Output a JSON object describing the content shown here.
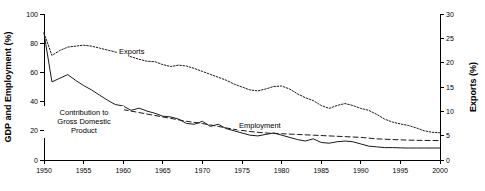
{
  "chart_data": {
    "type": "line",
    "title": "",
    "xlabel": "",
    "ylabel": "GDP and Employment (%)",
    "y2label": "Exports (%)",
    "xlim": [
      1950,
      2000
    ],
    "ylim": [
      0,
      100
    ],
    "y2lim": [
      0,
      30
    ],
    "grid": false,
    "legend_position": "inline-annotations",
    "x_ticks": [
      1950,
      1955,
      1960,
      1965,
      1970,
      1975,
      1980,
      1985,
      1990,
      1995,
      2000
    ],
    "y_ticks": [
      0,
      20,
      40,
      60,
      80,
      100
    ],
    "y2_ticks": [
      0,
      5,
      10,
      15,
      20,
      25,
      30
    ],
    "annotations": [
      {
        "text": "Exports",
        "x": 1963,
        "y_axis": "right"
      },
      {
        "text": "Contribution to",
        "x": 1957,
        "y_axis": "left"
      },
      {
        "text": "Gross Domestic",
        "x": 1957,
        "y_axis": "left"
      },
      {
        "text": "Product",
        "x": 1957,
        "y_axis": "left"
      },
      {
        "text": "Employment",
        "x": 1979,
        "y_axis": "left"
      }
    ],
    "series": [
      {
        "name": "Exports",
        "axis": "right",
        "style": "dotted",
        "x": [
          1950,
          1951,
          1952,
          1953,
          1954,
          1955,
          1956,
          1957,
          1958,
          1959,
          1960,
          1961,
          1962,
          1963,
          1964,
          1965,
          1966,
          1967,
          1968,
          1969,
          1970,
          1971,
          1972,
          1973,
          1974,
          1975,
          1976,
          1977,
          1978,
          1979,
          1980,
          1981,
          1982,
          1983,
          1984,
          1985,
          1986,
          1987,
          1988,
          1989,
          1990,
          1991,
          1992,
          1993,
          1994,
          1995,
          1996,
          1997,
          1998,
          1999,
          2000
        ],
        "values": [
          26.1,
          21.5,
          22.5,
          23.2,
          23.4,
          23.6,
          23.4,
          23.0,
          22.6,
          22.2,
          21.8,
          21.2,
          20.7,
          20.3,
          20.2,
          19.6,
          19.2,
          19.5,
          19.3,
          18.8,
          18.2,
          17.6,
          17.0,
          16.4,
          15.6,
          15.0,
          14.4,
          14.2,
          14.6,
          15.1,
          15.2,
          14.6,
          13.6,
          12.8,
          12.2,
          11.2,
          10.6,
          11.2,
          11.6,
          11.2,
          10.6,
          10.2,
          9.4,
          8.4,
          7.8,
          7.4,
          7.1,
          6.6,
          6.0,
          5.7,
          5.6
        ]
      },
      {
        "name": "Contribution to Gross Domestic Product",
        "axis": "left",
        "style": "solid",
        "x": [
          1950,
          1951,
          1952,
          1953,
          1954,
          1955,
          1956,
          1957,
          1958,
          1959,
          1960,
          1961,
          1962,
          1963,
          1964,
          1965,
          1966,
          1967,
          1968,
          1969,
          1970,
          1971,
          1972,
          1973,
          1974,
          1975,
          1976,
          1977,
          1978,
          1979,
          1980,
          1981,
          1982,
          1983,
          1984,
          1985,
          1986,
          1987,
          1988,
          1989,
          1990,
          1991,
          1992,
          1993,
          1994,
          1995,
          1996,
          1997,
          1998,
          1999,
          2000
        ],
        "values": [
          87.0,
          53.5,
          56.0,
          58.5,
          54.5,
          51.0,
          48.0,
          44.5,
          41.0,
          38.0,
          37.0,
          34.0,
          35.5,
          33.5,
          32.0,
          30.0,
          29.5,
          28.0,
          25.0,
          24.5,
          26.5,
          23.0,
          24.5,
          21.5,
          20.0,
          18.5,
          17.0,
          16.5,
          17.5,
          18.5,
          17.0,
          15.5,
          14.0,
          13.0,
          14.5,
          12.0,
          11.5,
          12.5,
          13.0,
          12.5,
          11.0,
          9.5,
          9.0,
          8.5,
          8.5,
          8.3,
          8.2,
          8.2,
          8.2,
          8.2,
          8.2
        ]
      },
      {
        "name": "Employment",
        "axis": "left",
        "style": "dashed",
        "x": [
          1960,
          1962,
          1964,
          1966,
          1968,
          1970,
          1972,
          1974,
          1976,
          1978,
          1980,
          1982,
          1984,
          1986,
          1988,
          1990,
          1992,
          1994,
          1996,
          1998,
          2000
        ],
        "values": [
          34.5,
          32.5,
          30.5,
          28.5,
          26.5,
          25.0,
          23.0,
          21.0,
          19.5,
          18.5,
          18.0,
          17.5,
          17.0,
          16.5,
          16.0,
          15.5,
          14.5,
          14.0,
          13.6,
          13.4,
          13.3
        ]
      }
    ]
  },
  "axes": {
    "left_title": "GDP and Employment (%)",
    "right_title": "Exports (%)"
  },
  "colors": {
    "line": "#1a1a1a",
    "axis": "#000000",
    "background": "#ffffff"
  }
}
